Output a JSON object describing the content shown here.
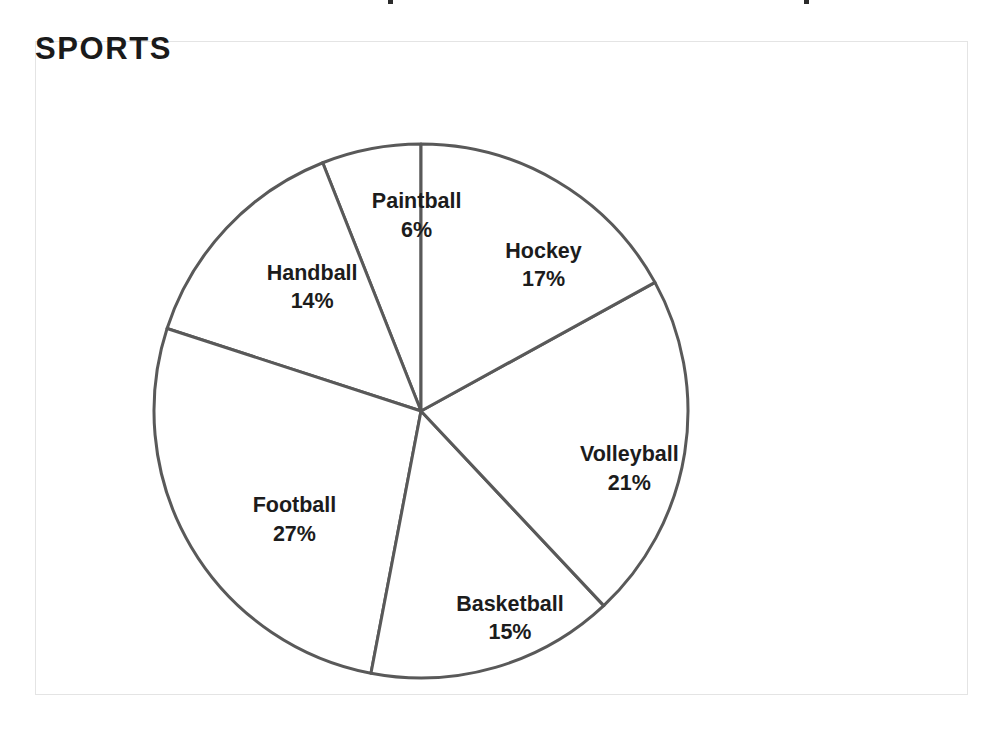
{
  "chart_title": "SPORTS",
  "frame": {
    "border_color": "#e4e4e4",
    "background": "#ffffff"
  },
  "chart_data": {
    "type": "pie",
    "title": "SPORTS",
    "xlabel": "",
    "ylabel": "",
    "units": "percent",
    "start_angle_deg": 0,
    "direction": "counterclockwise",
    "legend": "none",
    "grid": false,
    "labels_inside_slices": true,
    "stroke_color": "#595959",
    "slice_fill": "#ffffff",
    "categories": [
      "Paintball",
      "Handball",
      "Football",
      "Basketball",
      "Volleyball",
      "Hockey"
    ],
    "values": [
      6,
      14,
      27,
      15,
      21,
      17
    ],
    "slices": [
      {
        "label": "Paintball",
        "value": 6,
        "value_text": "6%",
        "label_x_pct": 40.8,
        "label_y_pct": 26.5
      },
      {
        "label": "Handball",
        "value": 14,
        "value_text": "14%",
        "label_x_pct": 29.6,
        "label_y_pct": 37.4
      },
      {
        "label": "Football",
        "value": 27,
        "value_text": "27%",
        "label_x_pct": 27.7,
        "label_y_pct": 73.0
      },
      {
        "label": "Basketball",
        "value": 15,
        "value_text": "15%",
        "label_x_pct": 50.8,
        "label_y_pct": 88.0
      },
      {
        "label": "Volleyball",
        "value": 21,
        "value_text": "21%",
        "label_x_pct": 63.6,
        "label_y_pct": 65.2
      },
      {
        "label": "Hockey",
        "value": 17,
        "value_text": "17%",
        "label_x_pct": 54.4,
        "label_y_pct": 34.1
      }
    ]
  }
}
